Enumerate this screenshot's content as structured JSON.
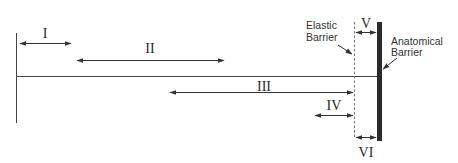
{
  "diagram": {
    "type": "barrier-range-of-motion",
    "colors": {
      "line": "#333333",
      "text": "#2a2a2a",
      "anatomical_barrier": "#2b2b2b",
      "background": "#ffffff"
    },
    "segments": [
      {
        "id": "I",
        "label": "I"
      },
      {
        "id": "II",
        "label": "II"
      },
      {
        "id": "III",
        "label": "III"
      },
      {
        "id": "IV",
        "label": "IV"
      },
      {
        "id": "V",
        "label": "V"
      },
      {
        "id": "VI",
        "label": "VI"
      }
    ],
    "barriers": {
      "elastic": {
        "line1": "Elastic",
        "line2": "Barrier"
      },
      "anatomical": {
        "line1": "Anatomical",
        "line2": "Barrier"
      }
    }
  }
}
